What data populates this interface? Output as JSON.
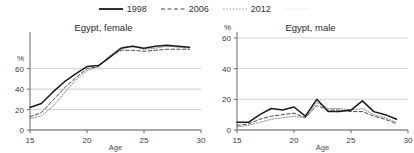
{
  "legend": {
    "items": [
      {
        "label": "1998",
        "style": "solid",
        "color": "#1a1a1a",
        "icon": "line-solid-icon"
      },
      {
        "label": "2006",
        "style": "dashed",
        "color": "#4a4a4a",
        "icon": "line-dashed-icon"
      },
      {
        "label": "2012",
        "style": "dotted",
        "color": "#8a8a8a",
        "icon": "line-dotted-icon"
      },
      {
        "label": ".",
        "style": "solid",
        "color": "#f0f0f0",
        "icon": "line-faint-icon"
      }
    ]
  },
  "charts": [
    {
      "id": "egypt-female",
      "title": "Egypt, female",
      "y_unit": "%",
      "xlabel": "Age",
      "yticks": [
        "0",
        "20",
        "40",
        "60"
      ],
      "xticks": [
        "15",
        "20",
        "25",
        "30"
      ]
    },
    {
      "id": "egypt-male",
      "title": "Egypt, male",
      "y_unit": "%",
      "xlabel": "Age",
      "yticks": [
        "0",
        "20",
        "40",
        "60"
      ],
      "xticks": [
        "15",
        "20",
        "25",
        "30"
      ]
    }
  ],
  "chart_data": [
    {
      "type": "line",
      "title": "Egypt, female",
      "xlabel": "Age",
      "ylabel": "%",
      "xlim": [
        15,
        30
      ],
      "ylim": [
        0,
        90
      ],
      "yticks": [
        0,
        20,
        40,
        60
      ],
      "xticks": [
        15,
        20,
        25,
        30
      ],
      "grid": "horizontal",
      "legend_position": "top-center-shared",
      "x": [
        15,
        16,
        17,
        18,
        19,
        20,
        21,
        22,
        23,
        24,
        25,
        26,
        27,
        28,
        29
      ],
      "series": [
        {
          "name": "1998",
          "style": "solid",
          "color": "#1a1a1a",
          "values": [
            22,
            26,
            37,
            47,
            55,
            62,
            63,
            71,
            80,
            82,
            80,
            82,
            83,
            82,
            81
          ]
        },
        {
          "name": "2006",
          "style": "dashed",
          "color": "#4a4a4a",
          "values": [
            13,
            17,
            29,
            41,
            51,
            60,
            62,
            72,
            78,
            78,
            77,
            78,
            79,
            79,
            79
          ]
        },
        {
          "name": "2012",
          "style": "dotted",
          "color": "#8a8a8a",
          "values": [
            11,
            14,
            23,
            36,
            49,
            58,
            62,
            73,
            81,
            82,
            79,
            80,
            82,
            81,
            80
          ]
        }
      ]
    },
    {
      "type": "line",
      "title": "Egypt, male",
      "xlabel": "Age",
      "ylabel": "%",
      "xlim": [
        15,
        30
      ],
      "ylim": [
        0,
        60
      ],
      "yticks": [
        0,
        20,
        40,
        60
      ],
      "xticks": [
        15,
        20,
        25,
        30
      ],
      "grid": "horizontal",
      "legend_position": "top-center-shared",
      "x": [
        15,
        16,
        17,
        18,
        19,
        20,
        21,
        22,
        23,
        24,
        25,
        26,
        27,
        28,
        29
      ],
      "series": [
        {
          "name": "1998",
          "style": "solid",
          "color": "#1a1a1a",
          "values": [
            5,
            5,
            10,
            14,
            13,
            15,
            9,
            20,
            12,
            12,
            13,
            19,
            12,
            10,
            7
          ]
        },
        {
          "name": "2006",
          "style": "dashed",
          "color": "#4a4a4a",
          "values": [
            3,
            4,
            7,
            9,
            10,
            11,
            8,
            16,
            13,
            13,
            12,
            12,
            9,
            7,
            4
          ]
        },
        {
          "name": "2012",
          "style": "dotted",
          "color": "#8a8a8a",
          "values": [
            2,
            3,
            5,
            7,
            8,
            9,
            8,
            18,
            14,
            14,
            13,
            14,
            10,
            8,
            5
          ]
        }
      ]
    }
  ]
}
